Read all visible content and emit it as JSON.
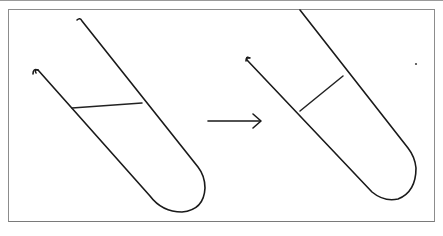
{
  "figure": {
    "description": "Two tilted test tubes with an arrow between them",
    "panels": [
      {
        "name": "before",
        "object": "test-tube",
        "liquid_surface": "horizontal"
      },
      {
        "name": "after",
        "object": "test-tube",
        "liquid_surface": "perpendicular to tube walls"
      }
    ],
    "arrow": {
      "direction": "right",
      "meaning": "transition"
    },
    "colors": {
      "ink": "#1a1a1a",
      "frame": "#8c8c8c",
      "background": "#ffffff"
    }
  }
}
